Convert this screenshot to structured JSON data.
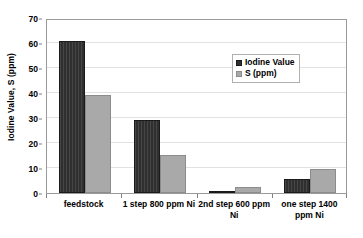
{
  "chart_data": {
    "type": "bar",
    "title": "",
    "subtitle": "",
    "xlabel": "",
    "ylabel": "Iodine Value, S (ppm)",
    "categories": [
      "feedstock",
      "1 step 800 ppm Ni",
      "2nd step 600 ppm Ni",
      "one step 1400 ppm Ni"
    ],
    "series": [
      {
        "name": "Iodine Value",
        "color": "#2f2f2f",
        "values": [
          61,
          29.3,
          1,
          5.6
        ]
      },
      {
        "name": "S (ppm)",
        "color": "#a9a9a9",
        "values": [
          39.2,
          15.3,
          2.6,
          9.7
        ]
      }
    ],
    "ylim": [
      0,
      70
    ],
    "ytick_step": 10,
    "yticks": [
      0,
      10,
      20,
      30,
      40,
      50,
      60,
      70
    ],
    "ytick_labels": [
      "0",
      "10",
      "20",
      "30",
      "40",
      "50",
      "60",
      "70"
    ],
    "grid": true,
    "grid_axis": "y",
    "legend_position": "inside-top-right",
    "plot_background": "#ffffff",
    "border_color": "#9a9a9a"
  }
}
